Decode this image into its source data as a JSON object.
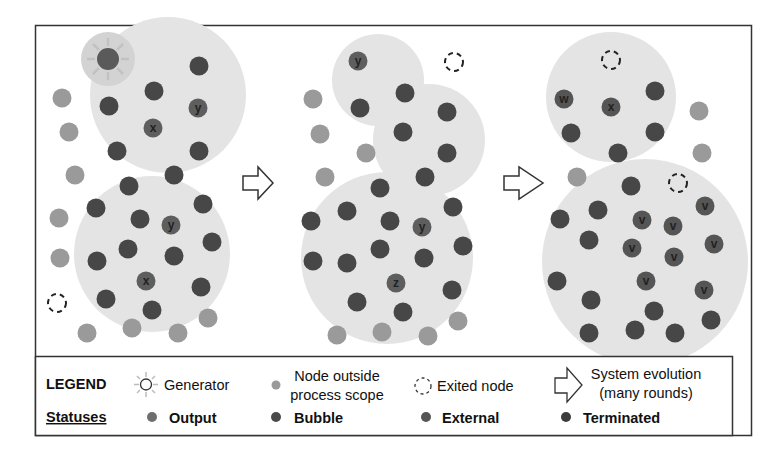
{
  "colors": {
    "bubble_fill": "#e4e4e4",
    "generator_halo": "#d0d0d0",
    "output": "#6e6e6e",
    "bubble": "#4a4a4a",
    "external": "#555555",
    "terminated": "#3c3c3c",
    "outside": "#9a9a9a",
    "frame": "#333333"
  },
  "panels": [
    {
      "name": "panel-initial",
      "bubbles": [
        {
          "cx": 0.5,
          "cy": 0.5,
          "r": 1
        }
      ],
      "nodes": []
    }
  ],
  "node_labels": {
    "p1_top_y": "y",
    "p1_top_x": "x",
    "p1_bot_y": "y",
    "p1_bot_x": "x",
    "p2_top_y": "y",
    "p2_mid_y": "y",
    "p2_z": "z",
    "p3_w": "w",
    "p3_x": "x",
    "p3_v": "v"
  },
  "legend": {
    "title": "LEGEND",
    "generator": "Generator",
    "outside_line1": "Node outside",
    "outside_line2": "process scope",
    "exited": "Exited node",
    "evolution_line1": "System evolution",
    "evolution_line2": "(many rounds)",
    "statuses_title": "Statuses",
    "output": "Output",
    "bubble": "Bubble",
    "external": "External",
    "terminated": "Terminated"
  }
}
